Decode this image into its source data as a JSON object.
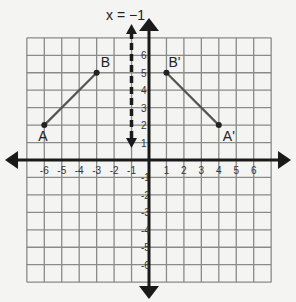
{
  "diagram": {
    "type": "coordinate-plane-reflection",
    "line_of_reflection_label": "x = −1",
    "line_of_reflection_x": -1,
    "x_range": [
      -7,
      7
    ],
    "y_range": [
      -7,
      7
    ],
    "x_tick_labels": [
      "-6",
      "-5",
      "-4",
      "-3",
      "-2",
      "-1",
      "1",
      "2",
      "3",
      "4",
      "5",
      "6"
    ],
    "y_tick_labels": [
      "6",
      "5",
      "4",
      "3",
      "2",
      "1",
      "-1",
      "-2",
      "-3",
      "-4",
      "-5",
      "-6"
    ],
    "points": [
      {
        "label": "A",
        "x": -6,
        "y": 2
      },
      {
        "label": "B",
        "x": -3,
        "y": 5
      },
      {
        "label": "B'",
        "x": 1,
        "y": 5
      },
      {
        "label": "A'",
        "x": 4,
        "y": 2
      }
    ],
    "segments": [
      {
        "from": "A",
        "to": "B"
      },
      {
        "from": "B'",
        "to": "A'"
      }
    ],
    "colors": {
      "grid": "#8a8a8a",
      "axis": "#1a1a1a",
      "segment": "#555555",
      "background": "#f4f4f2"
    }
  }
}
